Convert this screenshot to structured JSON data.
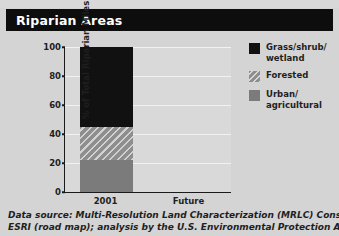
{
  "header": {
    "title": "Riparian Areas"
  },
  "chart_data": {
    "type": "bar",
    "stacked": true,
    "title": "Riparian Areas",
    "xlabel": "",
    "ylabel": "% of Total Riparian Miles",
    "categories": [
      "2001",
      "Future"
    ],
    "ylim": [
      0,
      100
    ],
    "yticks": [
      0,
      20,
      40,
      60,
      80,
      100
    ],
    "ytick_labels": [
      "0",
      "20",
      "40",
      "60",
      "80",
      "100"
    ],
    "grid": true,
    "legend_position": "right",
    "series": [
      {
        "name": "Urban/\nagricultural",
        "legend_label_line1": "Urban/",
        "legend_label_line2": "agricultural",
        "color": "#7b7b7b",
        "pattern": "solid",
        "values": [
          22,
          null
        ]
      },
      {
        "name": "Forested",
        "legend_label_line1": "Forested",
        "legend_label_line2": "",
        "color": "#8e8e8e",
        "pattern": "diagonal-hatch",
        "values": [
          23,
          null
        ]
      },
      {
        "name": "Grass/shrub/\nwetland",
        "legend_label_line1": "Grass/shrub/",
        "legend_label_line2": "wetland",
        "color": "#111111",
        "pattern": "solid",
        "values": [
          55,
          null
        ]
      }
    ]
  },
  "legend": {
    "items": [
      {
        "label_line1": "Grass/shrub/",
        "label_line2": "wetland",
        "swatch": "black-square"
      },
      {
        "label_line1": "Forested",
        "label_line2": "",
        "swatch": "hatched-square"
      },
      {
        "label_line1": "Urban/",
        "label_line2": "agricultural",
        "swatch": "gray-square"
      }
    ]
  },
  "axes": {
    "y_label": "% of Total Riparian Miles",
    "y_ticks": [
      "100",
      "80",
      "60",
      "40",
      "20",
      "0"
    ],
    "x_ticks": [
      "2001",
      "Future"
    ]
  },
  "footnote": {
    "line1": "Data source: Multi-Resolution Land Characterization (MRLC) Consortium and",
    "line2": "ESRI (road map); analysis by the U.S. Environmental Protection Agency and"
  },
  "colors": {
    "background": "#d4d4d4",
    "plot_background": "#d9d9d9",
    "title_bar": "#0d0d0d",
    "grass": "#111111",
    "forested": "#8e8e8e",
    "urban": "#7b7b7b",
    "axis": "#1a1a1a"
  }
}
